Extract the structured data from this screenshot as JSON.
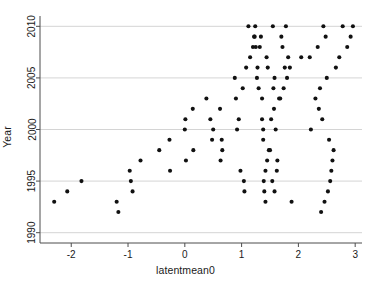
{
  "chart_data": {
    "type": "scatter",
    "title": "",
    "xlabel": "latentmean0",
    "ylabel": "Year",
    "xlim": [
      -2.55,
      3.12
    ],
    "ylim": [
      1989.0,
      2011.0
    ],
    "xticks": [
      -2,
      -1,
      0,
      1,
      2,
      3
    ],
    "xticklabels": [
      "-2",
      "-1",
      "0",
      "1",
      "2",
      "3"
    ],
    "yticks": [
      1990,
      1995,
      2000,
      2005,
      2010
    ],
    "yticklabels": [
      "1990",
      "1995",
      "2000",
      "2005",
      "2010"
    ],
    "grid": "horizontal",
    "legend": "none",
    "marker": {
      "shape": "circle",
      "color": "#111111",
      "size_px": 4.1
    },
    "series": [
      {
        "name": "latentmean0 by Year",
        "points": [
          [
            -2.3,
            1993
          ],
          [
            -2.07,
            1994
          ],
          [
            -1.82,
            1995
          ],
          [
            -1.2,
            1993
          ],
          [
            -1.17,
            1992
          ],
          [
            -0.97,
            1996
          ],
          [
            -0.95,
            1995
          ],
          [
            -0.92,
            1994
          ],
          [
            -0.78,
            1997
          ],
          [
            -0.45,
            1998
          ],
          [
            -0.27,
            1999
          ],
          [
            -0.26,
            1996
          ],
          [
            0.0,
            2000
          ],
          [
            0.01,
            2001
          ],
          [
            0.02,
            1997
          ],
          [
            0.14,
            2002
          ],
          [
            0.15,
            1998
          ],
          [
            0.38,
            2003
          ],
          [
            0.45,
            2001
          ],
          [
            0.48,
            1999
          ],
          [
            0.5,
            2000
          ],
          [
            0.62,
            2002
          ],
          [
            0.65,
            1999
          ],
          [
            0.66,
            1998
          ],
          [
            0.63,
            1997
          ],
          [
            0.88,
            2005
          ],
          [
            0.9,
            2003
          ],
          [
            0.92,
            2000
          ],
          [
            0.95,
            2001
          ],
          [
            0.98,
            1996
          ],
          [
            1.02,
            2004
          ],
          [
            1.04,
            1995
          ],
          [
            1.05,
            1994
          ],
          [
            1.08,
            2006
          ],
          [
            1.12,
            2010
          ],
          [
            1.15,
            2007
          ],
          [
            1.2,
            2008
          ],
          [
            1.22,
            2009
          ],
          [
            1.23,
            2009
          ],
          [
            1.24,
            2010
          ],
          [
            1.25,
            2008
          ],
          [
            1.27,
            2005
          ],
          [
            1.28,
            2006
          ],
          [
            1.3,
            2004
          ],
          [
            1.32,
            2008
          ],
          [
            1.34,
            2009
          ],
          [
            1.36,
            2003
          ],
          [
            1.38,
            2000
          ],
          [
            1.36,
            2001
          ],
          [
            1.38,
            1999
          ],
          [
            1.39,
            1995
          ],
          [
            1.4,
            1994
          ],
          [
            1.42,
            1993
          ],
          [
            1.44,
            2007
          ],
          [
            1.46,
            2006
          ],
          [
            1.42,
            1996
          ],
          [
            1.45,
            1997
          ],
          [
            1.48,
            1998
          ],
          [
            1.5,
            1998
          ],
          [
            1.52,
            2001
          ],
          [
            1.54,
            1995
          ],
          [
            1.55,
            2010
          ],
          [
            1.56,
            2004
          ],
          [
            1.57,
            2002
          ],
          [
            1.58,
            2005
          ],
          [
            1.6,
            2000
          ],
          [
            1.58,
            1994
          ],
          [
            1.62,
            1996
          ],
          [
            1.63,
            1997
          ],
          [
            1.66,
            2003
          ],
          [
            1.68,
            2003
          ],
          [
            1.7,
            2009
          ],
          [
            1.72,
            2008
          ],
          [
            1.74,
            2004
          ],
          [
            1.76,
            2006
          ],
          [
            1.78,
            2010
          ],
          [
            1.8,
            2005
          ],
          [
            1.82,
            2007
          ],
          [
            1.85,
            2006
          ],
          [
            1.88,
            1993
          ],
          [
            2.05,
            2007
          ],
          [
            2.2,
            2007
          ],
          [
            2.22,
            2000
          ],
          [
            2.3,
            2003
          ],
          [
            2.34,
            2008
          ],
          [
            2.36,
            2002
          ],
          [
            2.38,
            2004
          ],
          [
            2.4,
            1992
          ],
          [
            2.42,
            2001
          ],
          [
            2.44,
            2010
          ],
          [
            2.46,
            1993
          ],
          [
            2.48,
            2009
          ],
          [
            2.5,
            2005
          ],
          [
            2.52,
            1994
          ],
          [
            2.54,
            1999
          ],
          [
            2.56,
            1995
          ],
          [
            2.58,
            1996
          ],
          [
            2.6,
            1997
          ],
          [
            2.62,
            1998
          ],
          [
            2.66,
            2006
          ],
          [
            2.72,
            2007
          ],
          [
            2.78,
            2010
          ],
          [
            2.86,
            2008
          ],
          [
            2.92,
            2009
          ],
          [
            2.96,
            2010
          ]
        ]
      }
    ]
  },
  "axis": {
    "x_title": "latentmean0",
    "y_title": "Year"
  }
}
